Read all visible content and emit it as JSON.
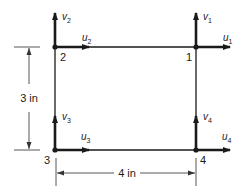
{
  "diagram": {
    "type": "finite-element-rectangle",
    "colors": {
      "stroke": "#1a1a1a",
      "dim": "#444444",
      "background": "#ffffff"
    },
    "nodes": [
      {
        "id": "1",
        "label": "1",
        "x": 196,
        "y": 47,
        "dofs": {
          "u": "u",
          "u_sub": "1",
          "v": "v",
          "v_sub": "1"
        }
      },
      {
        "id": "2",
        "label": "2",
        "x": 55,
        "y": 47,
        "dofs": {
          "u": "u",
          "u_sub": "2",
          "v": "v",
          "v_sub": "2"
        }
      },
      {
        "id": "3",
        "label": "3",
        "x": 55,
        "y": 150,
        "dofs": {
          "u": "u",
          "u_sub": "3",
          "v": "v",
          "v_sub": "3"
        }
      },
      {
        "id": "4",
        "label": "4",
        "x": 196,
        "y": 150,
        "dofs": {
          "u": "u",
          "u_sub": "4",
          "v": "v",
          "v_sub": "4"
        }
      }
    ],
    "dimensions": {
      "height": {
        "label": "3 in"
      },
      "width": {
        "label": "4 in"
      }
    }
  }
}
